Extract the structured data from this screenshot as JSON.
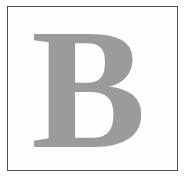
{
  "card": {
    "glyph": "B",
    "glyph_color": "#9b9b9b",
    "border_color": "#4e4e4e",
    "page_background": "#ffffff",
    "frame_background": "#fefefe",
    "typeface_style": "serif",
    "weight": "bold"
  }
}
